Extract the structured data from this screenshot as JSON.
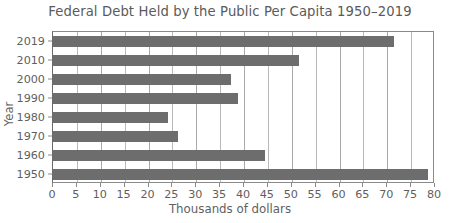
{
  "chart_data": {
    "type": "bar",
    "orientation": "horizontal",
    "title": "Federal Debt Held by the Public Per Capita 1950–2019",
    "xlabel": "Thousands of dollars",
    "ylabel": "Year",
    "categories": [
      "2019",
      "2010",
      "2000",
      "1990",
      "1980",
      "1970",
      "1960",
      "1950"
    ],
    "values": [
      71.5,
      51.5,
      37.3,
      38.8,
      24.0,
      26.2,
      44.3,
      78.5
    ],
    "xlim": [
      0,
      80
    ],
    "xticks": [
      0,
      5,
      10,
      15,
      20,
      25,
      30,
      35,
      40,
      45,
      50,
      55,
      60,
      65,
      70,
      75,
      80
    ],
    "xtick_labels": [
      "0",
      "5",
      "10",
      "15",
      "20",
      "25",
      "30",
      "35",
      "40",
      "45",
      "50",
      "55",
      "60",
      "65",
      "70",
      "75",
      "80"
    ],
    "grid": "vertical",
    "legend": null,
    "bar_color": "#6d6d6d",
    "grid_color": "#b9b9b9",
    "axis_color": "#8a8a8a",
    "text_color": "#5f5f5f"
  }
}
